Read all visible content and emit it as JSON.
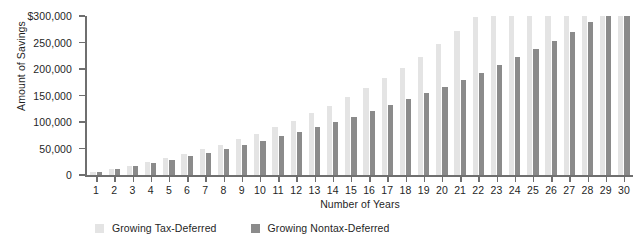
{
  "chart_data": {
    "type": "bar",
    "title": "",
    "xlabel": "Number of Years",
    "ylabel": "Amount of Savings",
    "ylim": [
      0,
      300000
    ],
    "ytick_labels": [
      "$300,000",
      "250,000",
      "200,000",
      "150,000",
      "100,000",
      "50,000",
      "0"
    ],
    "ytick_values": [
      300000,
      250000,
      200000,
      150000,
      100000,
      50000,
      0
    ],
    "grid": false,
    "legend_position": "bottom-left",
    "categories": [
      1,
      2,
      3,
      4,
      5,
      6,
      7,
      8,
      9,
      10,
      11,
      12,
      13,
      14,
      15,
      16,
      17,
      18,
      19,
      20,
      21,
      22,
      23,
      24,
      25,
      26,
      27,
      28,
      29,
      30
    ],
    "series": [
      {
        "name": "Growing Tax-Deferred",
        "color": "#e4e4e4",
        "values": [
          5400,
          11200,
          17500,
          24300,
          31700,
          39600,
          48200,
          57500,
          67500,
          78300,
          90000,
          102600,
          116200,
          130900,
          146700,
          163800,
          182200,
          202100,
          223600,
          246800,
          271800,
          298800,
          328000,
          359400,
          393300,
          429900,
          469400,
          512100,
          558200,
          608000
        ]
      },
      {
        "name": "Growing Nontax-Deferred",
        "color": "#8b8b8b",
        "values": [
          5200,
          10700,
          16400,
          22400,
          28700,
          35300,
          42200,
          49400,
          57000,
          64900,
          73200,
          81800,
          90900,
          100300,
          110200,
          120600,
          131400,
          142700,
          154500,
          166900,
          179800,
          193300,
          207400,
          222100,
          237500,
          253600,
          270400,
          288000,
          306400,
          325600
        ]
      }
    ],
    "plotted_values": {
      "tax_deferred": [
        5400,
        11200,
        17500,
        24300,
        31700,
        39600,
        48200,
        57500,
        67500,
        78300,
        90000,
        102600,
        116200,
        130900,
        146700,
        163800,
        182200,
        202100,
        223600,
        246800,
        271800,
        287000
      ],
      "note": "bars clipped at axis maximum of 300,000"
    }
  },
  "axes": {
    "y_title": "Amount of Savings",
    "x_title": "Number of Years"
  },
  "legend": {
    "items": [
      {
        "label": "Growing Tax-Deferred",
        "color": "#e4e4e4"
      },
      {
        "label": "Growing Nontax-Deferred",
        "color": "#8b8b8b"
      }
    ]
  },
  "colors": {
    "tax_deferred": "#e4e4e4",
    "nontax_deferred": "#8b8b8b",
    "axis": "#6f6f6f",
    "text": "#1f1f1f",
    "background": "#ffffff"
  }
}
